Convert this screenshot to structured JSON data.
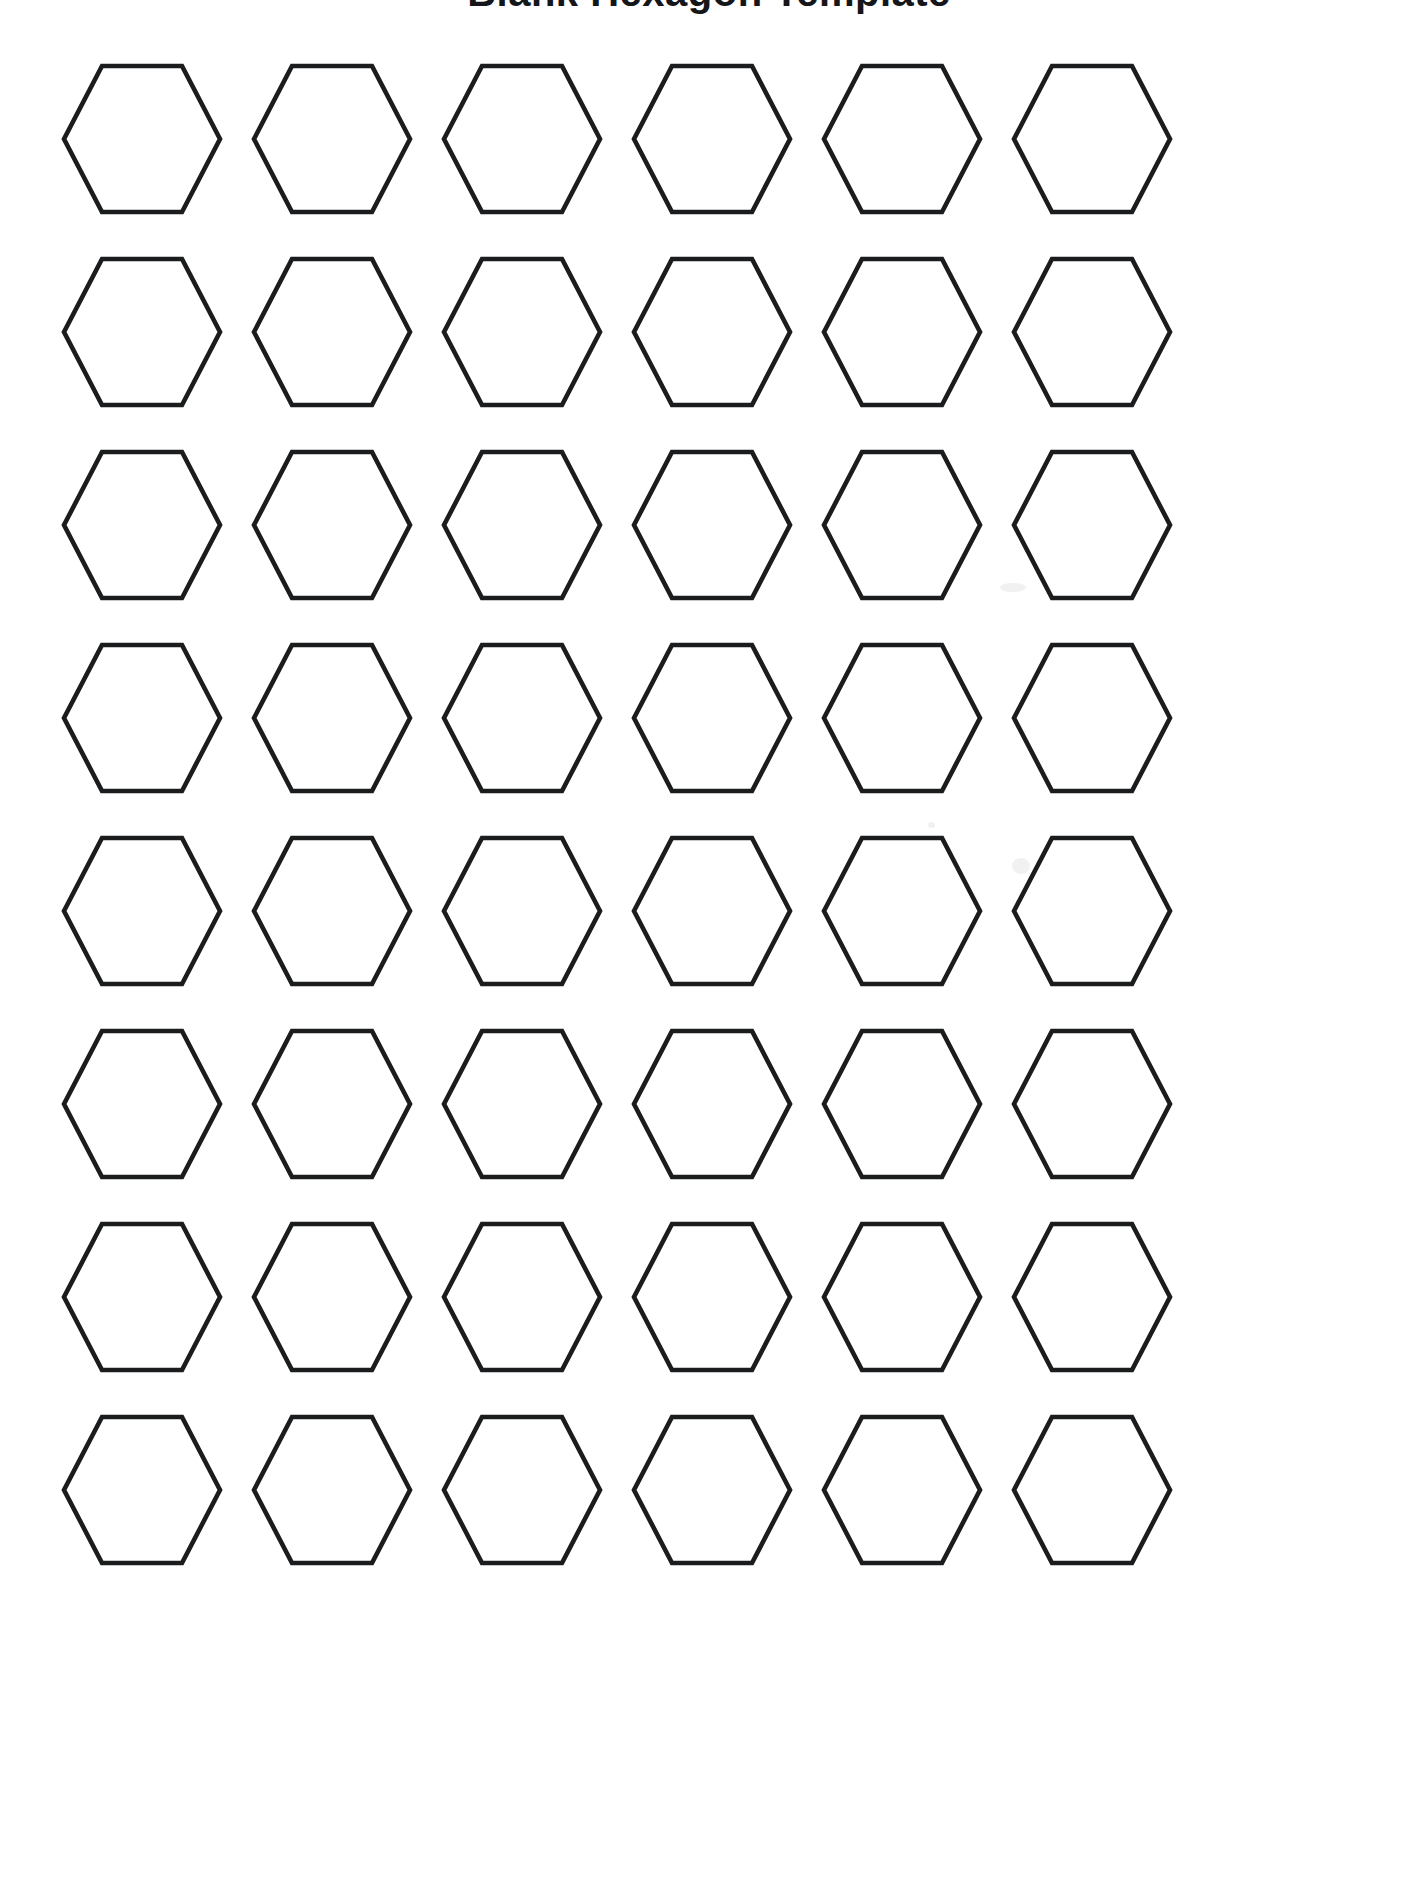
{
  "document": {
    "title": "Blank Hexagon Template",
    "title_visibility": "cropped-at-top-edge",
    "background_color": "#ffffff",
    "page_width": 1418,
    "page_height": 1888
  },
  "shape": {
    "name": "hexagon",
    "orientation": "flat-top",
    "fill_color": "#ffffff",
    "stroke_color": "#1b1c1e",
    "stroke_width": 4.6,
    "width": 160,
    "height": 150
  },
  "grid": {
    "rows": 8,
    "columns": 6,
    "total_shapes": 48,
    "column_spacing": 190,
    "row_spacing": 193,
    "origin_x": 62,
    "origin_y": 64,
    "row_tops": [
      64,
      257,
      450,
      643,
      836,
      1029,
      1222,
      1415
    ],
    "column_lefts": [
      62,
      252,
      442,
      632,
      822,
      1012
    ]
  },
  "artifacts": [
    {
      "name": "scan-smudge-upper-right",
      "x": 1000,
      "y": 583,
      "w": 26,
      "h": 9
    },
    {
      "name": "scan-smudge-row5",
      "x": 1012,
      "y": 858,
      "w": 18,
      "h": 16
    },
    {
      "name": "scan-speck-row5",
      "x": 928,
      "y": 822,
      "w": 7,
      "h": 6
    }
  ]
}
